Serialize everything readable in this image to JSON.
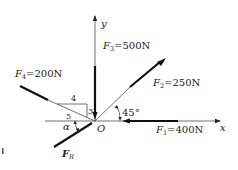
{
  "diagram": {
    "type": "force-diagram",
    "axes": {
      "x_label": "x",
      "y_label": "y",
      "origin_label": "O"
    },
    "forces": [
      {
        "id": "F1",
        "symbol": "F",
        "subscript": "1",
        "eq": "=",
        "value": "400N",
        "angle_note": "along +x axis, arrow pointing toward origin"
      },
      {
        "id": "F2",
        "symbol": "F",
        "subscript": "2",
        "eq": "=",
        "value": "250N",
        "angle_note": "45°"
      },
      {
        "id": "F3",
        "symbol": "F",
        "subscript": "3",
        "eq": "=",
        "value": "500N",
        "angle_note": "along y axis, arrow pointing toward origin"
      },
      {
        "id": "F4",
        "symbol": "F",
        "subscript": "4",
        "eq": "=",
        "value": "200N",
        "angle_note": "slope 3:4 (hyp 5)"
      }
    ],
    "resultant": {
      "symbol": "F",
      "subscript": "R",
      "angle_label": "α"
    },
    "angle_45": "45°",
    "slope_triangle": {
      "horizontal": "4",
      "vertical": "3",
      "hypotenuse": "5"
    },
    "colors": {
      "line": "#111111",
      "thin_line": "#333333",
      "background": "#ffffff"
    }
  }
}
